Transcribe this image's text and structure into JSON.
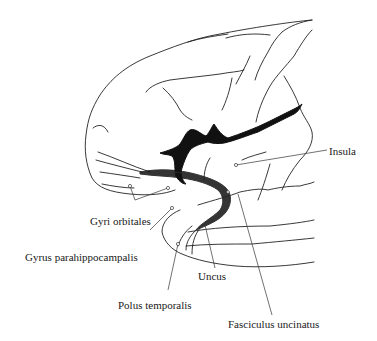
{
  "figure": {
    "colors": {
      "ink": "#222222",
      "background": "#ffffff"
    }
  },
  "labels": [
    {
      "id": "insula",
      "text": "Insula",
      "x": 329,
      "y": 145
    },
    {
      "id": "gyri-orbitales",
      "text": "Gyri orbitales",
      "x": 90,
      "y": 215
    },
    {
      "id": "gyrus-parahippocampalis",
      "text": "Gyrus parahippocampalis",
      "x": 25,
      "y": 251
    },
    {
      "id": "uncus",
      "text": "Uncus",
      "x": 198,
      "y": 270
    },
    {
      "id": "polus-temporalis",
      "text": "Polus temporalis",
      "x": 118,
      "y": 299
    },
    {
      "id": "fasciculus-uncinatus",
      "text": "Fasciculus uncinatus",
      "x": 228,
      "y": 318
    }
  ]
}
